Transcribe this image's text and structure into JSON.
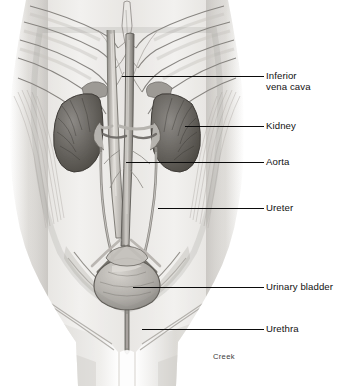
{
  "figure": {
    "background_color": "#ffffff",
    "line_color": "#0b0b0b",
    "text_color": "#111111",
    "credit": "Creek",
    "width": 354,
    "height": 386
  },
  "labels": [
    {
      "id": "inferior-vena-cava",
      "text": "Inferior\nvena cava",
      "lines": [
        "Inferior",
        "vena cava"
      ],
      "text_x": 266,
      "text_y": 70,
      "leader": {
        "x1": 122,
        "y1": 76,
        "x2": 264,
        "y2": 76
      }
    },
    {
      "id": "kidney",
      "text": "Kidney",
      "lines": [
        "Kidney"
      ],
      "text_x": 266,
      "text_y": 120,
      "leader": {
        "x1": 185,
        "y1": 126,
        "x2": 264,
        "y2": 126
      }
    },
    {
      "id": "aorta",
      "text": "Aorta",
      "lines": [
        "Aorta"
      ],
      "text_x": 266,
      "text_y": 156,
      "leader": {
        "x1": 126,
        "y1": 162,
        "x2": 264,
        "y2": 162
      }
    },
    {
      "id": "ureter",
      "text": "Ureter",
      "lines": [
        "Ureter"
      ],
      "text_x": 266,
      "text_y": 202,
      "leader": {
        "x1": 158,
        "y1": 208,
        "x2": 264,
        "y2": 208
      }
    },
    {
      "id": "urinary-bladder",
      "text": "Urinary bladder",
      "lines": [
        "Urinary bladder"
      ],
      "text_x": 266,
      "text_y": 281,
      "leader": {
        "x1": 133,
        "y1": 287,
        "x2": 264,
        "y2": 287
      }
    },
    {
      "id": "urethra",
      "text": "Urethra",
      "lines": [
        "Urethra"
      ],
      "text_x": 266,
      "text_y": 323,
      "leader": {
        "x1": 142,
        "y1": 329,
        "x2": 264,
        "y2": 329
      }
    }
  ],
  "signature": {
    "text": "Creek",
    "x": 213,
    "y": 352
  },
  "anatomy": {
    "structures": [
      "ribcage",
      "xiphoid-process",
      "costal-cartilage",
      "abdominal-wall-muscles",
      "left-kidney",
      "right-kidney",
      "adrenal-glands",
      "inferior-vena-cava",
      "abdominal-aorta",
      "renal-arteries",
      "renal-veins",
      "left-ureter",
      "right-ureter",
      "common-iliac-vessels",
      "pelvic-brim",
      "urinary-bladder",
      "urethra",
      "thighs"
    ],
    "palette": {
      "skin_light": "#efeeec",
      "skin_mid": "#d9d7d3",
      "muscle": "#c6c3be",
      "shadow": "#9b9793",
      "kidney_dark": "#5d5a57",
      "kidney_mid": "#7d7a76",
      "vessel_light": "#cfccc7",
      "vessel_dark": "#6f6c68",
      "outline": "#6b6865"
    }
  }
}
